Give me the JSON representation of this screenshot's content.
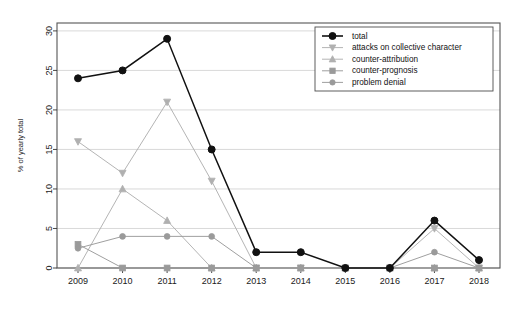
{
  "chart_data": {
    "type": "line",
    "title": "",
    "xlabel": "",
    "ylabel": "% of yearly total",
    "categories": [
      "2009",
      "2010",
      "2011",
      "2012",
      "2013",
      "2014",
      "2015",
      "2016",
      "2017",
      "2018"
    ],
    "x": [
      2009,
      2010,
      2011,
      2012,
      2013,
      2014,
      2015,
      2016,
      2017,
      2018
    ],
    "xlim": [
      2008.6,
      2018.4
    ],
    "ylim": [
      0,
      31
    ],
    "yticks": [
      0,
      5,
      10,
      15,
      20,
      25,
      30
    ],
    "xticks": [
      "2009",
      "2010",
      "2011",
      "2012",
      "2013",
      "2014",
      "2015",
      "2016",
      "2017",
      "2018"
    ],
    "grid": true,
    "legend_position": "top-right",
    "series": [
      {
        "name": "total",
        "color": "#111111",
        "marker": "filled-circle",
        "values": [
          24,
          25,
          29,
          15,
          2,
          2,
          0,
          0,
          6,
          1
        ]
      },
      {
        "name": "attacks on collective character",
        "color": "#b0b0b0",
        "marker": "triangle-down",
        "values": [
          16,
          12,
          21,
          11,
          0,
          0,
          0,
          0,
          5,
          0
        ]
      },
      {
        "name": "counter-attribution",
        "color": "#b0b0b0",
        "marker": "triangle-up",
        "values": [
          0,
          10,
          6,
          0,
          0,
          0,
          0,
          0,
          0,
          0
        ]
      },
      {
        "name": "counter-prognosis",
        "color": "#9a9a9a",
        "marker": "square",
        "values": [
          3,
          0,
          0,
          0,
          0,
          0,
          0,
          0,
          0,
          0
        ]
      },
      {
        "name": "problem denial",
        "color": "#9a9a9a",
        "marker": "circle",
        "values": [
          2.5,
          4,
          4,
          4,
          0,
          0,
          0,
          0,
          2,
          0
        ]
      }
    ]
  },
  "legend": {
    "entries": [
      {
        "label": "total"
      },
      {
        "label": "attacks on collective character"
      },
      {
        "label": "counter-attribution"
      },
      {
        "label": "counter-prognosis"
      },
      {
        "label": "problem denial"
      }
    ]
  },
  "axes": {
    "y_title": "% of yearly total",
    "y_ticks": [
      "0",
      "5",
      "10",
      "15",
      "20",
      "25",
      "30"
    ],
    "x_ticks": [
      "2009",
      "2010",
      "2011",
      "2012",
      "2013",
      "2014",
      "2015",
      "2016",
      "2017",
      "2018"
    ]
  }
}
